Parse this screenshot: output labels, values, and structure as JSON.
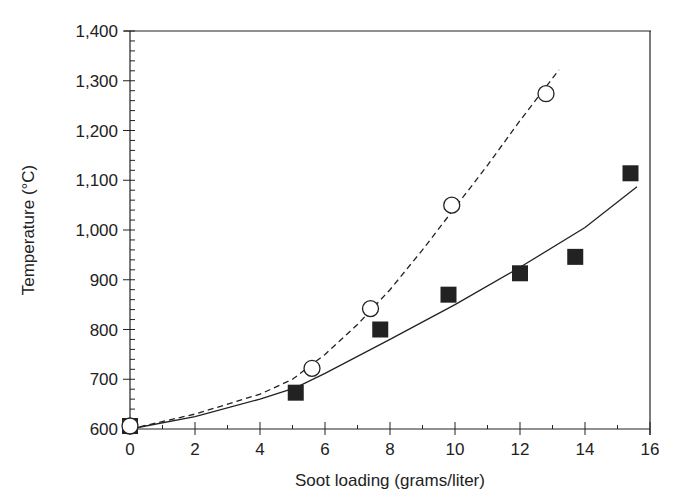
{
  "chart_data": {
    "type": "scatter",
    "title": "",
    "xlabel": "Soot loading (grams/liter)",
    "ylabel": "Temperature (°C)",
    "xlim": [
      0,
      16
    ],
    "ylim": [
      600,
      1400
    ],
    "x_ticks": [
      0,
      2,
      4,
      6,
      8,
      10,
      12,
      14,
      16
    ],
    "x_tick_labels": [
      "0",
      "2",
      "4",
      "6",
      "8",
      "10",
      "12",
      "14",
      "16"
    ],
    "y_ticks": [
      600,
      700,
      800,
      900,
      1000,
      1100,
      1200,
      1300,
      1400
    ],
    "y_tick_labels": [
      "600",
      "700",
      "800",
      "900",
      "1,000",
      "1,100",
      "1,200",
      "1,300",
      "1,400"
    ],
    "grid": false,
    "legend": null,
    "series": [
      {
        "name": "Filled squares",
        "marker": "square-filled",
        "x": [
          0,
          5.1,
          7.7,
          9.8,
          12.0,
          13.7,
          15.4
        ],
        "y": [
          606,
          673,
          800,
          870,
          913,
          946,
          1114
        ],
        "fit_line": "solid",
        "fit_curve": [
          [
            0,
            600
          ],
          [
            2,
            625
          ],
          [
            4,
            660
          ],
          [
            5.1,
            683
          ],
          [
            6,
            712
          ],
          [
            8,
            780
          ],
          [
            10,
            850
          ],
          [
            12,
            925
          ],
          [
            14,
            1005
          ],
          [
            15.6,
            1087
          ]
        ]
      },
      {
        "name": "Open circles",
        "marker": "circle-open",
        "x": [
          0,
          5.6,
          7.4,
          9.9,
          12.8
        ],
        "y": [
          606,
          722,
          842,
          1050,
          1274
        ],
        "fit_line": "dashed",
        "fit_curve": [
          [
            0,
            600
          ],
          [
            2,
            630
          ],
          [
            4,
            670
          ],
          [
            5,
            700
          ],
          [
            6,
            750
          ],
          [
            7,
            810
          ],
          [
            8,
            880
          ],
          [
            9,
            960
          ],
          [
            10,
            1045
          ],
          [
            11,
            1130
          ],
          [
            12,
            1220
          ],
          [
            13.2,
            1322
          ]
        ]
      }
    ]
  },
  "colors": {
    "ink": "#222222",
    "background": "#ffffff"
  }
}
